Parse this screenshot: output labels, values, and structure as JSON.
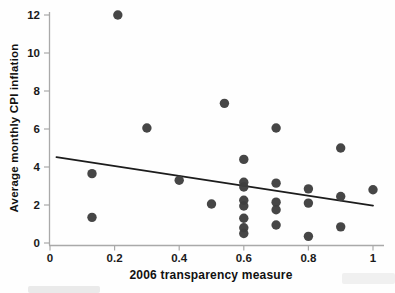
{
  "chart_data": {
    "type": "scatter",
    "title": "",
    "xlabel": "2006 transparency measure",
    "ylabel": "Average monthly CPI inflation",
    "xlim": [
      0,
      1.04
    ],
    "ylim": [
      0,
      12.6
    ],
    "grid": false,
    "x_ticks": [
      0,
      0.2,
      0.4,
      0.6,
      0.8,
      1
    ],
    "x_tick_labels": [
      "0",
      "0.2",
      "0.4",
      "0.6",
      "0.8",
      "1"
    ],
    "y_ticks": [
      0,
      2,
      4,
      6,
      8,
      10,
      12
    ],
    "y_tick_labels": [
      "0",
      "2",
      "4",
      "6",
      "8",
      "10",
      "12"
    ],
    "points": [
      [
        0.13,
        3.65
      ],
      [
        0.13,
        1.35
      ],
      [
        0.21,
        12.0
      ],
      [
        0.3,
        6.05
      ],
      [
        0.4,
        3.3
      ],
      [
        0.5,
        2.05
      ],
      [
        0.54,
        7.35
      ],
      [
        0.6,
        4.4
      ],
      [
        0.6,
        3.2
      ],
      [
        0.6,
        2.95
      ],
      [
        0.6,
        2.25
      ],
      [
        0.6,
        1.95
      ],
      [
        0.6,
        1.3
      ],
      [
        0.6,
        0.8
      ],
      [
        0.6,
        0.5
      ],
      [
        0.7,
        6.05
      ],
      [
        0.7,
        3.15
      ],
      [
        0.7,
        2.15
      ],
      [
        0.7,
        1.75
      ],
      [
        0.7,
        0.95
      ],
      [
        0.8,
        2.85
      ],
      [
        0.8,
        2.1
      ],
      [
        0.8,
        0.35
      ],
      [
        0.9,
        5.0
      ],
      [
        0.9,
        2.45
      ],
      [
        0.9,
        0.85
      ],
      [
        1.0,
        2.8
      ]
    ],
    "trend_line": {
      "x_start": 0.02,
      "y_start": 4.52,
      "x_end": 1.0,
      "y_end": 1.97
    },
    "point_color": "#3e3e3e",
    "line_color": "#1c1c1c",
    "axis_color": "#a9a9a9",
    "text_color": "#111111"
  }
}
